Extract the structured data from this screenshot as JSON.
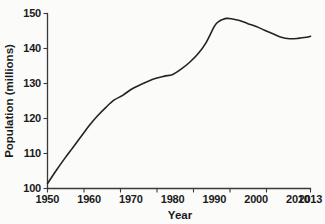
{
  "chart_data": {
    "type": "line",
    "title": "",
    "xlabel": "Year",
    "ylabel": "Population (millions)",
    "xlim": [
      1950,
      2013
    ],
    "ylim": [
      100,
      150
    ],
    "grid": false,
    "legend": null,
    "xticks": [
      1950,
      1960,
      1970,
      1980,
      1990,
      2000,
      2010,
      2013
    ],
    "xtick_labels": [
      "1950",
      "1960",
      "1970",
      "1980",
      "1990",
      "2000",
      "2010",
      "2013"
    ],
    "yticks": [
      100,
      110,
      120,
      130,
      140,
      150
    ],
    "ytick_labels": [
      "100",
      "110",
      "120",
      "130",
      "140",
      "150"
    ],
    "line_color": "#232323",
    "series": [
      {
        "name": "Population",
        "x": [
          1950,
          1952,
          1954,
          1956,
          1958,
          1960,
          1962,
          1964,
          1966,
          1968,
          1970,
          1972,
          1974,
          1976,
          1978,
          1980,
          1982,
          1984,
          1986,
          1988,
          1990,
          1991,
          1992,
          1993,
          1994,
          1996,
          1998,
          2000,
          2002,
          2004,
          2006,
          2008,
          2010,
          2012,
          2013
        ],
        "values": [
          101.4,
          105.0,
          108.4,
          111.6,
          114.8,
          118.0,
          120.8,
          123.2,
          125.3,
          126.6,
          128.3,
          129.5,
          130.6,
          131.5,
          132.1,
          132.6,
          134.1,
          136.0,
          138.4,
          141.7,
          146.4,
          147.7,
          148.3,
          148.6,
          148.5,
          148.0,
          147.1,
          146.3,
          145.2,
          144.2,
          143.2,
          142.8,
          142.9,
          143.2,
          143.5
        ]
      }
    ],
    "annotations": []
  },
  "axes": {
    "xaxis_name": "year-axis",
    "yaxis_name": "population-axis"
  }
}
